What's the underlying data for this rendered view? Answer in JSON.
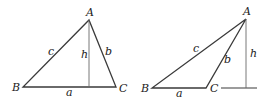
{
  "colors": {
    "line": "#3a3a3a",
    "altitude": "#6a6a6a",
    "text": "#222222"
  },
  "left_triangle": {
    "vertices": {
      "A": "A",
      "B": "B",
      "C": "C"
    },
    "sides": {
      "a": "a",
      "b": "b",
      "c": "c"
    },
    "height": "h"
  },
  "right_triangle": {
    "vertices": {
      "A": "A",
      "B": "B",
      "C": "C"
    },
    "sides": {
      "a": "a",
      "b": "b",
      "c": "c"
    },
    "height": "h"
  }
}
